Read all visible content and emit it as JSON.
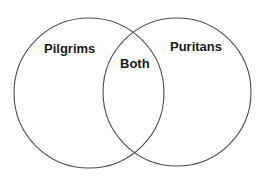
{
  "diagram": {
    "type": "venn",
    "title": "",
    "background_color": "#ffffff",
    "stroke_color": "#4d4d4d",
    "text_color": "#1a1a1a",
    "sets": [
      {
        "id": "left",
        "label": "Pilgrims",
        "center_x": 89,
        "center_y": 93,
        "radius": 75
      },
      {
        "id": "right",
        "label": "Puritans",
        "center_x": 177,
        "center_y": 92,
        "radius": 74
      }
    ],
    "intersection": {
      "id": "both",
      "label": "Both"
    }
  }
}
